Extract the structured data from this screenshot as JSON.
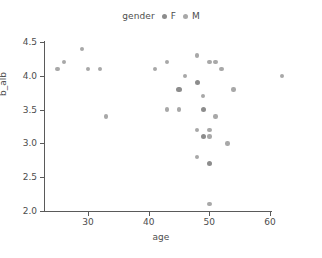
{
  "chart_data": {
    "type": "scatter",
    "title": "",
    "xlabel": "age",
    "ylabel": "b_alb",
    "xlim": [
      23,
      64
    ],
    "ylim": [
      2.0,
      4.5
    ],
    "xticks": [
      "30",
      "40",
      "50",
      "60"
    ],
    "xtick_values": [
      30,
      40,
      50,
      60
    ],
    "yticks": [
      "4.5",
      "4.0",
      "3.5",
      "3.0",
      "2.5",
      "2.0"
    ],
    "ytick_values": [
      4.5,
      4.0,
      3.5,
      3.0,
      2.5,
      2.0
    ],
    "grid": false,
    "legend": {
      "title": "gender",
      "position": "top-center",
      "entries": [
        {
          "label": "F",
          "color": "#8c8c8c"
        },
        {
          "label": "M",
          "color": "#a8a8a8"
        }
      ]
    },
    "series": [
      {
        "name": "F",
        "color": "#8c8c8c",
        "points": [
          {
            "x": 45,
            "y": 3.8
          },
          {
            "x": 48,
            "y": 3.9
          },
          {
            "x": 49,
            "y": 3.5
          },
          {
            "x": 49,
            "y": 3.1
          },
          {
            "x": 50,
            "y": 2.7
          }
        ]
      },
      {
        "name": "M",
        "color": "#a8a8a8",
        "points": [
          {
            "x": 25,
            "y": 4.1
          },
          {
            "x": 26,
            "y": 4.2
          },
          {
            "x": 29,
            "y": 4.4
          },
          {
            "x": 30,
            "y": 4.1
          },
          {
            "x": 32,
            "y": 4.1
          },
          {
            "x": 33,
            "y": 3.4
          },
          {
            "x": 41,
            "y": 4.1
          },
          {
            "x": 43,
            "y": 4.2
          },
          {
            "x": 43,
            "y": 3.5
          },
          {
            "x": 45,
            "y": 3.5
          },
          {
            "x": 46,
            "y": 4.0
          },
          {
            "x": 48,
            "y": 4.3
          },
          {
            "x": 48,
            "y": 3.2
          },
          {
            "x": 48,
            "y": 2.8
          },
          {
            "x": 49,
            "y": 3.7
          },
          {
            "x": 50,
            "y": 4.2
          },
          {
            "x": 50,
            "y": 3.2
          },
          {
            "x": 50,
            "y": 3.1
          },
          {
            "x": 50,
            "y": 2.1
          },
          {
            "x": 51,
            "y": 4.2
          },
          {
            "x": 51,
            "y": 3.4
          },
          {
            "x": 52,
            "y": 4.1
          },
          {
            "x": 53,
            "y": 3.0
          },
          {
            "x": 54,
            "y": 3.8
          },
          {
            "x": 62,
            "y": 4.0
          }
        ]
      }
    ]
  }
}
